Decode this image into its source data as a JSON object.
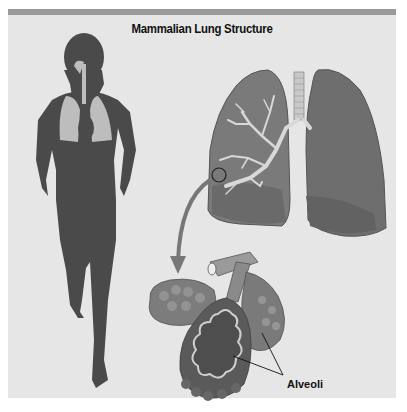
{
  "figure": {
    "title": "Mammalian Lung Structure",
    "labels": {
      "alveoli": "Alveoli"
    },
    "parts": [
      {
        "name": "human silhouette",
        "role": "body showing lung location"
      },
      {
        "name": "lungs",
        "role": "pair of lungs with trachea and bronchial tree"
      },
      {
        "name": "magnification circle",
        "role": "highlights region of lung enlarged below"
      },
      {
        "name": "curved arrow",
        "role": "points from lung detail to alveoli enlargement"
      },
      {
        "name": "alveolar clusters",
        "role": "enlarged bronchiole with alveoli"
      }
    ],
    "colors": {
      "panel": "#e6e6e6",
      "topbar": "#9a9a9a",
      "silhouette": "#4a4a4a",
      "lung_dark": "#6e6e6e",
      "lung_light": "#a8a8a8"
    }
  }
}
